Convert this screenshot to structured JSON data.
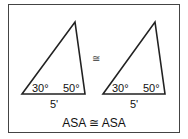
{
  "diagram": {
    "type": "congruent-triangles",
    "congruence_symbol": "≅",
    "caption": "ASA ≅ ASA",
    "triangles": [
      {
        "name": "left-triangle",
        "angle_left": "30°",
        "angle_right": "50°",
        "base_label": "5'"
      },
      {
        "name": "right-triangle",
        "angle_left": "30°",
        "angle_right": "50°",
        "base_label": "5'"
      }
    ],
    "stroke_color": "#222222"
  }
}
